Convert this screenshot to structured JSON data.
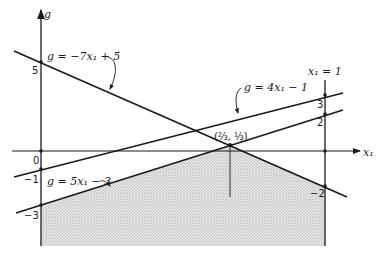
{
  "figure": {
    "axes": {
      "vertical_label": "g",
      "horizontal_label": "x₁",
      "boundary_line_label": "x₁ = 1"
    },
    "lines": [
      {
        "id": "line-a",
        "label": "g = −7x₁ + 5",
        "slope": -7,
        "intercept": 5
      },
      {
        "id": "line-b",
        "label": "g = 4x₁ − 1",
        "slope": 4,
        "intercept": -1
      },
      {
        "id": "line-c",
        "label": "g = 5x₁ − 3",
        "slope": 5,
        "intercept": -3
      }
    ],
    "tick_labels_left": [
      "5",
      "0",
      "−1",
      "−3"
    ],
    "tick_labels_right": [
      "3",
      "2",
      "−2"
    ],
    "intersection_label": "(⅔, ⅓)",
    "shaded_region": "area below g = 5x₁ − 3 and g = −7x₁ + 5 for 0 ≤ x₁ ≤ 1",
    "colors": {
      "ink": "#1a1a1a",
      "shade": "#c9c9c9"
    }
  }
}
